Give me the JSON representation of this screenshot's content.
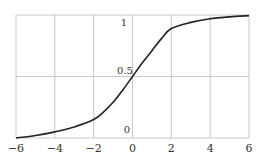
{
  "chart_data": {
    "type": "line",
    "title": "",
    "xlabel": "",
    "ylabel": "",
    "xlim": [
      -6,
      6
    ],
    "ylim": [
      0,
      1
    ],
    "grid": true,
    "legend": null,
    "x_ticks": [
      "-6",
      "-4",
      "-2",
      "0",
      "2",
      "4",
      "6"
    ],
    "y_ticks": [
      "0",
      "0.5",
      "1"
    ],
    "series": [
      {
        "name": "S-curve",
        "x": [
          -6,
          -5,
          -4,
          -3,
          -2,
          -1.5,
          -1,
          -0.5,
          0,
          0.5,
          1,
          1.5,
          2,
          3,
          4,
          5,
          6
        ],
        "y": [
          0.0,
          0.02,
          0.05,
          0.09,
          0.15,
          0.21,
          0.29,
          0.39,
          0.5,
          0.61,
          0.71,
          0.81,
          0.89,
          0.94,
          0.97,
          0.985,
          0.995
        ]
      }
    ]
  },
  "colors": {
    "grid": "#c8c8c8",
    "line": "#222222",
    "text": "#333333"
  }
}
